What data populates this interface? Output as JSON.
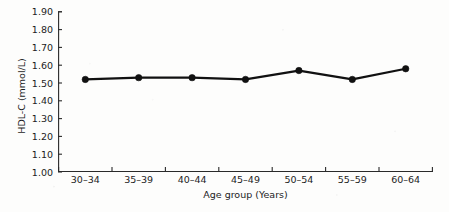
{
  "chart_data": {
    "type": "line",
    "title": "",
    "xlabel": "Age group (Years)",
    "ylabel": "HDL-C (mmol/L)",
    "categories": [
      "30–34",
      "35–39",
      "40–44",
      "45–49",
      "50–54",
      "55–59",
      "60–64"
    ],
    "values": [
      1.52,
      1.53,
      1.53,
      1.52,
      1.57,
      1.52,
      1.58
    ],
    "series": [
      {
        "name": "HDL-C",
        "values": [
          1.52,
          1.53,
          1.53,
          1.52,
          1.57,
          1.52,
          1.58
        ]
      }
    ],
    "ylim": [
      1.0,
      1.9
    ],
    "ytick_labels": [
      "1.00",
      "1.10",
      "1.20",
      "1.30",
      "1.40",
      "1.50",
      "1.60",
      "1.70",
      "1.80",
      "1.90"
    ],
    "ytick_values": [
      1.0,
      1.1,
      1.2,
      1.3,
      1.4,
      1.5,
      1.6,
      1.7,
      1.8,
      1.9
    ],
    "grid": false,
    "legend": false,
    "legend_position": "none",
    "marker": "filled-circle",
    "line_color": "#111111",
    "marker_color": "#111111",
    "axis_color": "#2a2a2a",
    "background_color": "#fdfdfc",
    "spines": [
      "left",
      "bottom"
    ]
  },
  "axes": {
    "y_title": "HDL-C (mmol/L)",
    "x_title": "Age group (Years)"
  }
}
